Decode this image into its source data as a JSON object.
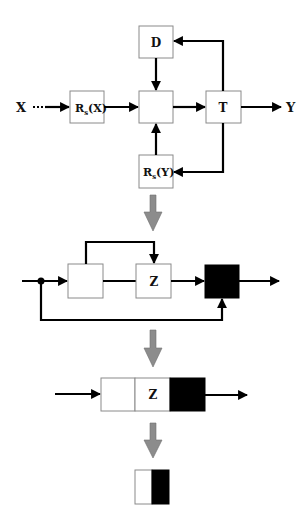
{
  "diagram": {
    "stage1": {
      "input_label": "X",
      "output_label": "Y",
      "boxes": {
        "rsx": {
          "label": "R",
          "sub": "s",
          "arg": "(X)"
        },
        "d": {
          "label": "D"
        },
        "center": {
          "label": ""
        },
        "t": {
          "label": "T"
        },
        "rsy": {
          "label": "R",
          "sub": "s",
          "arg": "(Y)"
        }
      }
    },
    "stage2": {
      "boxes": {
        "left": {
          "label": ""
        },
        "z": {
          "label": "Z"
        },
        "black": {
          "label": ""
        }
      }
    },
    "stage3": {
      "segments": [
        {
          "label": "",
          "fill": "#ffffff"
        },
        {
          "label": "Z",
          "fill": "#ffffff"
        },
        {
          "label": "",
          "fill": "#000000"
        }
      ]
    },
    "stage4": {
      "segments": [
        {
          "fill": "#ffffff"
        },
        {
          "fill": "#000000"
        }
      ]
    },
    "colors": {
      "transition_arrow": "#8c8c8c",
      "wire": "#000000",
      "box_border": "#8a8a8a"
    }
  }
}
